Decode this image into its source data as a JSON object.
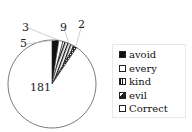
{
  "chart_data": {
    "type": "pie",
    "title": "",
    "categories": [
      "avoid",
      "every",
      "kind",
      "evil",
      "Correct"
    ],
    "values": [
      5,
      3,
      9,
      2,
      181
    ],
    "data_labels": [
      "5",
      "3",
      "9",
      "2",
      "181"
    ],
    "legend_position": "right",
    "fills": [
      "solid-black",
      "white",
      "vertical-stripes",
      "dark-pattern",
      "white"
    ]
  },
  "legend": {
    "items": [
      {
        "label": "avoid",
        "fill": "#111111"
      },
      {
        "label": "every",
        "fill": "#ffffff"
      },
      {
        "label": "kind",
        "fill": "stripes"
      },
      {
        "label": "evil",
        "fill": "dark"
      },
      {
        "label": "Correct",
        "fill": "#ffffff"
      }
    ]
  }
}
